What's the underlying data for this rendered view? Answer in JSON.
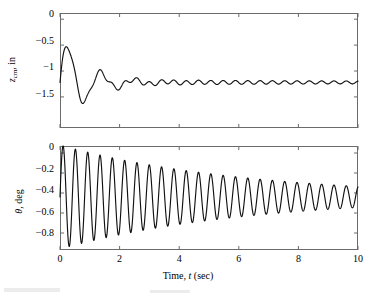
{
  "figure": {
    "background_color": "#ffffff",
    "line_color": "#111111",
    "axis_color": "#6b6b6b"
  },
  "chart_data": [
    {
      "type": "line",
      "id": "cm-displacement",
      "title": "",
      "xlabel": "Time, t (sec)",
      "ylabel": "z_cm, in",
      "ylabel_symbol": "z",
      "ylabel_subscript": "cm",
      "ylabel_units": "in",
      "xlim": [
        0,
        10
      ],
      "ylim": [
        -2.1,
        0.12
      ],
      "xticks": [
        0,
        2,
        4,
        6,
        8,
        10
      ],
      "xticklabels": [
        "0",
        "2",
        "4",
        "6",
        "8",
        "10"
      ],
      "yticks": [
        0,
        -0.5,
        -1,
        -1.5
      ],
      "yticklabels": [
        "0",
        "-0.5",
        "-1",
        "-1.5"
      ],
      "grid": false,
      "legend": false,
      "show_xticklabels": false,
      "series": [
        {
          "name": "z_cm",
          "model": "damped_sine_plus_ripple",
          "steady_state": -1.22,
          "amplitude": 0.95,
          "decay_rate": 1.15,
          "frequency_hz": 0.9,
          "phase_deg": -90,
          "ripple_amplitude": 0.055,
          "ripple_decay_rate": 0.07,
          "ripple_frequency_hz": 2.42,
          "ripple_phase_deg": -90,
          "x": [
            0,
            0.25,
            0.5,
            0.75,
            1.0,
            1.25,
            1.5,
            1.75,
            2.0,
            2.25,
            2.5,
            2.75,
            3.0,
            3.25,
            3.5,
            3.75,
            4.0,
            4.5,
            5.0,
            5.5,
            6.0,
            6.5,
            7.0,
            7.5,
            8.0,
            8.5,
            9.0,
            9.5,
            10.0
          ],
          "y": [
            0.0,
            -0.98,
            -1.82,
            -1.58,
            -0.68,
            -1.12,
            -1.46,
            -1.41,
            -1.04,
            -1.09,
            -1.36,
            -1.29,
            -1.13,
            -1.13,
            -1.3,
            -1.24,
            -1.18,
            -1.28,
            -1.18,
            -1.27,
            -1.19,
            -1.26,
            -1.19,
            -1.26,
            -1.2,
            -1.25,
            -1.2,
            -1.25,
            -1.22
          ]
        }
      ]
    },
    {
      "type": "line",
      "id": "pitch-angle",
      "title": "",
      "xlabel": "Time, t (sec)",
      "ylabel": "theta, deg",
      "ylabel_symbol": "θ",
      "ylabel_units": "deg",
      "xlim": [
        0,
        10
      ],
      "ylim": [
        -0.97,
        0.07
      ],
      "xticks": [
        0,
        2,
        4,
        6,
        8,
        10
      ],
      "xticklabels": [
        "0",
        "2",
        "4",
        "6",
        "8",
        "10"
      ],
      "yticks": [
        0,
        -0.2,
        -0.4,
        -0.6,
        -0.8
      ],
      "yticklabels": [
        "0",
        "-0.2",
        "-0.4",
        "-0.6",
        "-0.8"
      ],
      "grid": false,
      "legend": false,
      "show_xticklabels": true,
      "series": [
        {
          "name": "theta",
          "model": "damped_sine",
          "steady_state": -0.44,
          "amplitude": 0.52,
          "decay_rate": 0.16,
          "frequency_hz": 2.42,
          "phase_deg": -90,
          "x": [
            0,
            0.21,
            0.42,
            0.62,
            0.83,
            1.03,
            1.24,
            1.45,
            1.65,
            2.07,
            2.48,
            2.89,
            3.31,
            3.72,
            4.13,
            4.55,
            4.96,
            5.37,
            5.79,
            6.2,
            6.61,
            7.02,
            7.44,
            7.85,
            8.26,
            8.68,
            9.09,
            9.5,
            9.92
          ],
          "y": [
            0.0,
            -0.94,
            -0.05,
            -0.87,
            -0.08,
            -0.85,
            -0.11,
            -0.82,
            -0.13,
            -0.15,
            -0.17,
            -0.19,
            -0.2,
            -0.21,
            -0.22,
            -0.24,
            -0.25,
            -0.26,
            -0.27,
            -0.28,
            -0.29,
            -0.3,
            -0.31,
            -0.32,
            -0.33,
            -0.34,
            -0.35,
            -0.36,
            -0.37
          ]
        }
      ]
    }
  ],
  "axis_labels": {
    "x_axis_title_prefix": "Time, ",
    "x_axis_title_symbol": "t",
    "x_axis_title_units": " (sec)",
    "top_y_symbol": "z",
    "top_y_subscript": "cm",
    "top_y_units": ", in",
    "bottom_y_symbol": "θ",
    "bottom_y_units": ", deg"
  },
  "ticks": {
    "x": [
      "0",
      "2",
      "4",
      "6",
      "8",
      "10"
    ],
    "y_top": [
      "0",
      "−0.5",
      "−1",
      "−1.5"
    ],
    "y_bottom": [
      "0",
      "−0.2",
      "−0.4",
      "−0.6",
      "−0.8"
    ]
  }
}
